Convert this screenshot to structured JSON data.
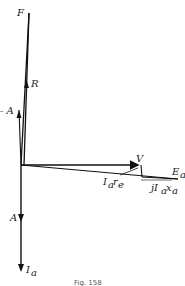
{
  "diagram": {
    "type": "phasor-diagram",
    "labels": {
      "F": "F",
      "R": "R",
      "neg_A": "- A",
      "V": "V",
      "Ea": "E",
      "Ea_sub": "a",
      "Iare": "I",
      "Iare_sub1": "a",
      "Iare_r": "r",
      "Iare_sub2": "e",
      "jIaxa_j": "jI",
      "jIaxa_sub1": "a",
      "jIaxa_x": "x",
      "jIaxa_sub2": "a",
      "A": "A",
      "Ia": "I",
      "Ia_sub": "a"
    },
    "caption": "Fig. 158",
    "colors": {
      "line": "#111111",
      "background": "#ffffff"
    }
  }
}
